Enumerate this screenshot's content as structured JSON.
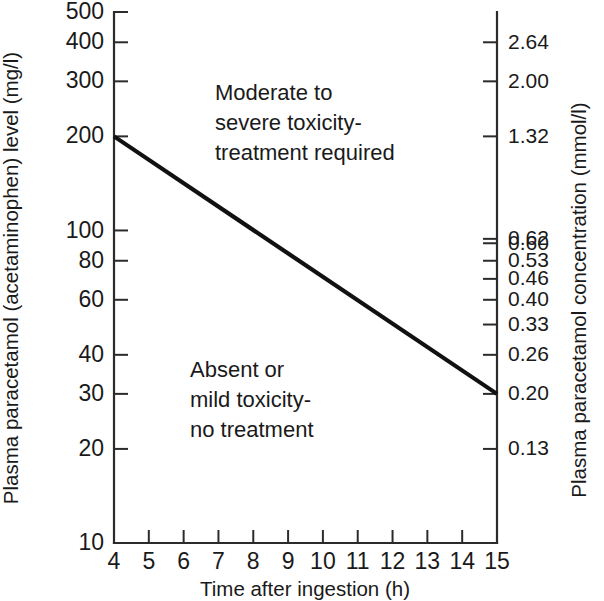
{
  "chart_data": {
    "type": "line",
    "title": "",
    "subtitle": "",
    "xlabel": "Time after ingestion (h)",
    "ylabel": "Plasma paracetamol (acetaminophen) level (mg/l)",
    "y2label": "Plasma paracetamol concentration (mmol/l)",
    "xlim": [
      4,
      15
    ],
    "ylim": [
      10,
      500
    ],
    "yscale": "log",
    "grid": false,
    "legend": null,
    "x_ticks": [
      4,
      5,
      6,
      7,
      8,
      9,
      10,
      11,
      12,
      13,
      14,
      15
    ],
    "x_tick_labels": [
      "4",
      "5",
      "6",
      "7",
      "8",
      "9",
      "10",
      "11",
      "12",
      "13",
      "14",
      "15"
    ],
    "y_ticks": [
      500,
      400,
      300,
      200,
      100,
      80,
      60,
      40,
      30,
      20,
      10
    ],
    "y_tick_labels": [
      "500",
      "400",
      "300",
      "200",
      "100",
      "80",
      "60",
      "40",
      "30",
      "20",
      "10"
    ],
    "y2_ticks": [
      400,
      300,
      200,
      94,
      91,
      80,
      70,
      60,
      50,
      40,
      30,
      20
    ],
    "y2_tick_labels": [
      "2.64",
      "2.00",
      "1.32",
      "0.62",
      "0.60",
      "0.53",
      "0.46",
      "0.40",
      "0.33",
      "0.26",
      "0.20",
      "0.13"
    ],
    "series": [
      {
        "name": "treatment-line",
        "x": [
          4,
          15
        ],
        "values": [
          200,
          30
        ]
      }
    ],
    "annotations": [
      {
        "name": "upper-region-label",
        "lines": [
          "Moderate to",
          "severe toxicity-",
          "treatment required"
        ],
        "x": 7.0,
        "y": 300
      },
      {
        "name": "lower-region-label",
        "lines": [
          "Absent or",
          "mild toxicity-",
          "no treatment"
        ],
        "x": 6.6,
        "y": 34
      }
    ]
  },
  "axes": {
    "left": {
      "title": "Plasma paracetamol (acetaminophen) level (mg/l)",
      "ticks": [
        {
          "label": "500",
          "value": 500
        },
        {
          "label": "400",
          "value": 400
        },
        {
          "label": "300",
          "value": 300
        },
        {
          "label": "200",
          "value": 200
        },
        {
          "label": "100",
          "value": 100
        },
        {
          "label": "80",
          "value": 80
        },
        {
          "label": "60",
          "value": 60
        },
        {
          "label": "40",
          "value": 40
        },
        {
          "label": "30",
          "value": 30
        },
        {
          "label": "20",
          "value": 20
        },
        {
          "label": "10",
          "value": 10
        }
      ]
    },
    "right": {
      "title": "Plasma paracetamol concentration (mmol/l)",
      "ticks": [
        {
          "label": "2.64"
        },
        {
          "label": "2.00"
        },
        {
          "label": "1.32"
        },
        {
          "label": "0.62"
        },
        {
          "label": "0.60"
        },
        {
          "label": "0.53"
        },
        {
          "label": "0.46"
        },
        {
          "label": "0.40"
        },
        {
          "label": "0.33"
        },
        {
          "label": "0.26"
        },
        {
          "label": "0.20"
        },
        {
          "label": "0.13"
        }
      ]
    },
    "bottom": {
      "title": "Time after ingestion (h)",
      "ticks": [
        {
          "label": "4"
        },
        {
          "label": "5"
        },
        {
          "label": "6"
        },
        {
          "label": "7"
        },
        {
          "label": "8"
        },
        {
          "label": "9"
        },
        {
          "label": "10"
        },
        {
          "label": "11"
        },
        {
          "label": "12"
        },
        {
          "label": "13"
        },
        {
          "label": "14"
        },
        {
          "label": "15"
        }
      ]
    }
  },
  "annotations": {
    "upper": {
      "line1": "Moderate to",
      "line2": "severe toxicity-",
      "line3": "treatment required"
    },
    "lower": {
      "line1": "Absent or",
      "line2": "mild toxicity-",
      "line3": "no treatment"
    }
  },
  "colors": {
    "ink": "#1a1a1a",
    "axis": "#2b2b2b",
    "line": "#111111",
    "background": "#ffffff"
  }
}
